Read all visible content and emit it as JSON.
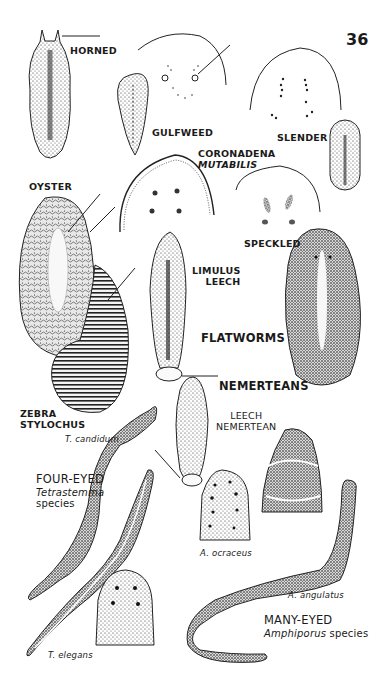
{
  "page": {
    "number": "36",
    "background": "#ffffff",
    "ink": "#1a1a1a"
  },
  "sections": {
    "flatworms": "FLATWORMS",
    "nemerteans": "NEMERTEANS"
  },
  "flatworms": [
    {
      "id": "horned",
      "label": "HORNED"
    },
    {
      "id": "gulfweed",
      "label": "GULFWEED"
    },
    {
      "id": "slender",
      "label": "SLENDER"
    },
    {
      "id": "coronadena",
      "label_line1": "CORONADENA",
      "label_line2": "MUTABILIS"
    },
    {
      "id": "oyster",
      "label": "OYSTER"
    },
    {
      "id": "speckled",
      "label": "SPECKLED"
    },
    {
      "id": "limulus-leech",
      "label_line1": "LIMULUS",
      "label_line2": "LEECH"
    },
    {
      "id": "zebra-stylochus",
      "label_line1": "ZEBRA",
      "label_line2": "STYLOCHUS"
    }
  ],
  "nemerteans": [
    {
      "id": "leech-nemertean",
      "label_line1": "LEECH",
      "label_line2": "NEMERTEAN"
    },
    {
      "id": "four-eyed",
      "label": "FOUR-EYED",
      "genus": "Tetrastemma",
      "genus_suffix": "species"
    },
    {
      "id": "many-eyed",
      "label": "MANY-EYED",
      "genus": "Amphiporus",
      "genus_suffix": "species"
    }
  ],
  "species_labels": {
    "t_candidum": "T. candidum",
    "t_elegans": "T. elegans",
    "a_ocraceus": "A. ocraceus",
    "a_angulatus": "A. angulatus"
  }
}
